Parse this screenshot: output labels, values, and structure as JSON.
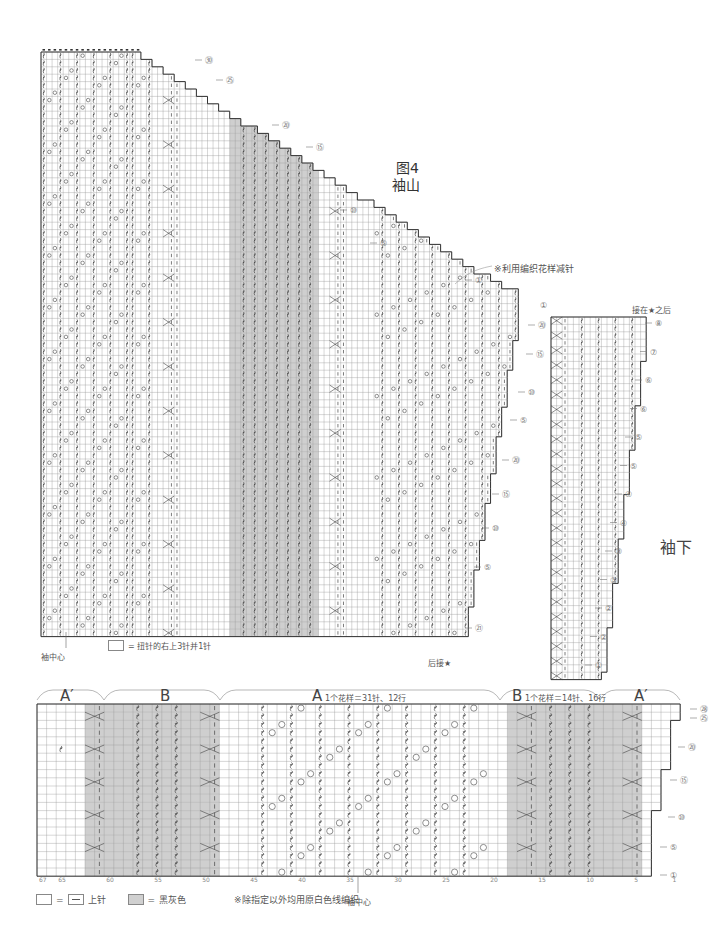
{
  "figure": {
    "title": "图4",
    "subtitle": "袖山"
  },
  "sleeve_cap": {
    "note": "※利用编织花样减针",
    "center_label": "袖中心",
    "attach_label": "后接★",
    "legend_symbol": "= 扭针的右上3针并1针",
    "row_markers": [
      "㉚",
      "㉕",
      "⑳",
      "⑮",
      "⑩",
      "⑤",
      "①"
    ],
    "lower_row_markers": [
      "⑳",
      "⑮",
      "⑩",
      "⑤",
      "⑳",
      "⑮",
      "⑩",
      "⑤",
      "㉑"
    ]
  },
  "sleeve_lower": {
    "label": "袖下",
    "attach_label": "接在★之后",
    "row_markers": [
      "⑧",
      "⑦",
      "⑥",
      "⑥",
      "⑤",
      "⑤",
      "④",
      "④",
      "③",
      "③",
      "②",
      "②",
      "①"
    ]
  },
  "pattern_chart": {
    "sections": [
      {
        "letter": "A′",
        "note": ""
      },
      {
        "letter": "B",
        "note": ""
      },
      {
        "letter": "A",
        "note": "1个花样＝31针、12行"
      },
      {
        "letter": "B",
        "note": "1个花样＝14针、16行"
      },
      {
        "letter": "A′",
        "note": ""
      }
    ],
    "column_ticks": [
      "67",
      "65",
      "60",
      "55",
      "50",
      "45",
      "40",
      "35",
      "30",
      "25",
      "20",
      "15",
      "10",
      "5",
      "1"
    ],
    "center_label": "袖中心",
    "row_markers": [
      "㉘",
      "㉕",
      "⑳",
      "⑮",
      "⑩",
      "⑤",
      "①"
    ]
  },
  "legend": {
    "blank_equals": "=",
    "purl_label": "上针",
    "grey_equals": "=",
    "grey_label": "黑灰色",
    "note": "※除指定以外均用原白色线编织"
  },
  "colors": {
    "grid_line": "#9a9a9a",
    "outline": "#333333",
    "shade": "#cfcfcf",
    "symbol": "#444444"
  }
}
